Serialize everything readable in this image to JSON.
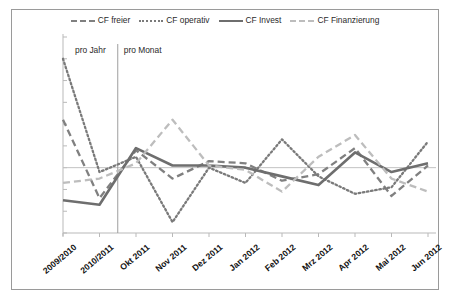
{
  "chart_data": {
    "type": "line",
    "title": "",
    "xlabel": "",
    "ylabel": "",
    "ylim": [
      -1500,
      3000
    ],
    "ytick_step": 500,
    "grid": false,
    "legend_position": "top-center",
    "categories": [
      "2009/2010",
      "2010/2011",
      "Okt 2011",
      "Nov 2011",
      "Dez 2011",
      "Jan 2012",
      "Feb 2012",
      "Mrz 2012",
      "Apr 2012",
      "Mai 2012",
      "Jun 2012"
    ],
    "ytick_labels": [
      "3.000",
      "2.500",
      "2.000",
      "1.500",
      "1.000",
      "500",
      "0",
      "-500",
      "-1.000",
      "-1.500"
    ],
    "ytick_values": [
      3000,
      2500,
      2000,
      1500,
      1000,
      500,
      0,
      -500,
      -1000,
      -1500
    ],
    "series": [
      {
        "name": "CF freier",
        "style": "dashed",
        "color": "#808080",
        "values": [
          1100,
          -700,
          400,
          -250,
          150,
          100,
          -300,
          -150,
          450,
          -650,
          50
        ]
      },
      {
        "name": "CF operativ",
        "style": "dotted",
        "color": "#7a7a7a",
        "values": [
          2500,
          -100,
          250,
          -1250,
          0,
          -350,
          650,
          -200,
          -600,
          -450,
          600
        ]
      },
      {
        "name": "CF Invest",
        "style": "solid",
        "color": "#6e6e6e",
        "values": [
          -750,
          -850,
          450,
          50,
          50,
          0,
          -200,
          -400,
          350,
          -100,
          100
        ]
      },
      {
        "name": "CF Finanzierung",
        "style": "dashed",
        "color": "#bdbdbd",
        "values": [
          -350,
          -250,
          100,
          1100,
          50,
          -50,
          -550,
          250,
          750,
          -250,
          -550
        ]
      }
    ],
    "annotations": [
      {
        "text": "pro Jahr",
        "category_span": "2009/2010-2010/2011"
      },
      {
        "text": "pro Monat",
        "category_span": "Okt 2011-Jun 2012"
      }
    ],
    "divider": {
      "after_category": "2010/2011",
      "description": "vertical separator between yearly and monthly periods"
    }
  },
  "legend": {
    "items": [
      {
        "label": "CF freier"
      },
      {
        "label": "CF operativ"
      },
      {
        "label": "CF Invest"
      },
      {
        "label": "CF Finanzierung"
      }
    ]
  }
}
